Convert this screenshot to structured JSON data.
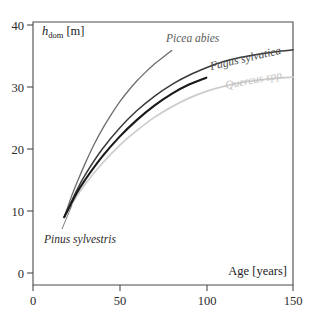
{
  "chart_data": {
    "type": "line",
    "title": "",
    "subtitle": "",
    "xlabel": "Age [years]",
    "ylabel": "h_dom [m]",
    "ylabel_base": "h",
    "ylabel_sub": "dom",
    "ylabel_unit": "[m]",
    "xlim": [
      0,
      160
    ],
    "ylim": [
      0,
      42
    ],
    "xticks": [
      0,
      50,
      100,
      150
    ],
    "xtick_labels": [
      "0",
      "50",
      "100",
      "150"
    ],
    "yticks": [
      0,
      10,
      20,
      30,
      40
    ],
    "ytick_labels": [
      "0",
      "10",
      "20",
      "30",
      "40"
    ],
    "grid": false,
    "legend_position": "inline-curve-labels",
    "series": [
      {
        "name": "Picea abies",
        "label": "Picea abies",
        "color": "#6d6d6d",
        "width": 1.3,
        "x": [
          18,
          22,
          26,
          30,
          35,
          40,
          45,
          50,
          55,
          60,
          65,
          70,
          75,
          80
        ],
        "y": [
          9.0,
          12.2,
          15.0,
          17.6,
          20.6,
          23.2,
          25.5,
          27.6,
          29.4,
          31.0,
          32.4,
          33.7,
          34.8,
          35.9
        ]
      },
      {
        "name": "Fagus sylvatica",
        "label": "Fagus sylvatica",
        "color": "#3a3a3a",
        "width": 1.5,
        "x": [
          18,
          25,
          30,
          40,
          50,
          60,
          70,
          80,
          90,
          100,
          110,
          120,
          130,
          140,
          150
        ],
        "y": [
          9.0,
          13.2,
          15.8,
          20.0,
          23.4,
          26.2,
          28.5,
          30.4,
          31.9,
          33.1,
          34.1,
          34.8,
          35.3,
          35.7,
          36.0
        ]
      },
      {
        "name": "Pinus sylvestris",
        "label": "Pinus sylvestris",
        "color": "#1a1a1a",
        "width": 2.1,
        "x": [
          18,
          25,
          30,
          40,
          50,
          60,
          70,
          80,
          90,
          100
        ],
        "y": [
          9.0,
          12.8,
          15.0,
          18.8,
          22.0,
          24.7,
          27.0,
          28.9,
          30.4,
          31.5
        ]
      },
      {
        "name": "Quercus spp.",
        "label": "Quercus spp.",
        "color": "#cdcdcd",
        "width": 1.8,
        "x": [
          18,
          25,
          30,
          40,
          50,
          60,
          70,
          80,
          90,
          100,
          110,
          120,
          130,
          140,
          150
        ],
        "y": [
          9.0,
          12.3,
          14.3,
          17.7,
          20.6,
          23.0,
          25.1,
          26.8,
          28.2,
          29.3,
          30.1,
          30.7,
          31.1,
          31.4,
          31.6
        ]
      }
    ],
    "annotations": [
      {
        "name": "Picea abies",
        "text": "Picea abies",
        "rotation": 0,
        "color": "#5a5a5a"
      },
      {
        "name": "Fagus sylvatica",
        "text": "Fagus sylvatica",
        "rotation": -14,
        "color": "#4a4a4a"
      },
      {
        "name": "Quercus spp.",
        "text": "Quercus spp.",
        "rotation": -11,
        "color": "#c2c2c2"
      },
      {
        "name": "Pinus sylvestris",
        "text": "Pinus sylvestris",
        "rotation": 0,
        "color": "#2a2a2a"
      }
    ]
  },
  "colors": {
    "background": "#ffffff",
    "frame": "#4a4a4a",
    "text": "#1c1c1c",
    "picea": "#6d6d6d",
    "fagus": "#3a3a3a",
    "pinus": "#1a1a1a",
    "quercus": "#cdcdcd"
  }
}
